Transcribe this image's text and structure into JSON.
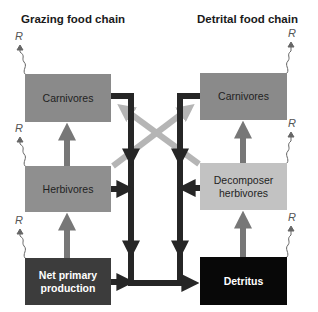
{
  "titles": {
    "grazing": "Grazing food chain",
    "detrital": "Detrital food chain"
  },
  "respiration_label": "R",
  "boxes": {
    "grazing_carnivores": {
      "label": "Carnivores",
      "fill": "#8a8a8a",
      "text_color": "#1f1f1f"
    },
    "herbivores": {
      "label": "Herbivores",
      "fill": "#8f8f8f",
      "text_color": "#1f1f1f"
    },
    "net_primary_production": {
      "label_line1": "Net primary",
      "label_line2": "production",
      "fill": "#3c3c3c",
      "text_color": "#ffffff"
    },
    "detrital_carnivores": {
      "label": "Carnivores",
      "fill": "#8a8a8a",
      "text_color": "#1f1f1f"
    },
    "decomposer_herbivores": {
      "label_line1": "Decomposer",
      "label_line2": "herbivores",
      "fill": "#c2c2c2",
      "text_color": "#1f1f1f"
    },
    "detritus": {
      "label": "Detritus",
      "fill": "#080808",
      "text_color": "#ffffff"
    }
  },
  "colors": {
    "trophic_arrow": "#777777",
    "cross_arrow": "#b5b5b5",
    "detritus_flow": "#262626",
    "respiration_line": "#666666"
  }
}
